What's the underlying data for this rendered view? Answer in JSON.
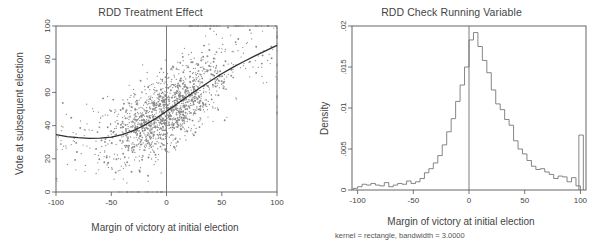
{
  "figure": {
    "width": 602,
    "height": 243,
    "background": "#ffffff",
    "panels": [
      "left",
      "right"
    ]
  },
  "chart_data": [
    {
      "type": "scatter",
      "panel": "left",
      "title": "RDD Treatment Effect",
      "xlabel": "Margin of victory at initial election",
      "ylabel": "Vote at subsequent election",
      "xlim": [
        -100,
        100
      ],
      "ylim": [
        0,
        100
      ],
      "xticks": [
        -100,
        -50,
        0,
        50,
        100
      ],
      "xtick_labels": [
        "-100",
        "-50",
        "0",
        "50",
        "100"
      ],
      "yticks": [
        0,
        20,
        40,
        60,
        80,
        100
      ],
      "ytick_labels": [
        "0",
        "20",
        "40",
        "60",
        "80",
        "100"
      ],
      "grid": false,
      "legend": "none",
      "marker_color": "#8a8a8a",
      "line_color": "#2f2f2f",
      "cutoff_line": {
        "x": 0,
        "color": "#6d6d6d",
        "label": "RDD cutoff at 0"
      },
      "fit_line": {
        "description": "quadratic-like fitted polynomial through scatter, continuous at cutoff",
        "points": [
          {
            "x": -100,
            "y": 34.5
          },
          {
            "x": -90,
            "y": 33.4
          },
          {
            "x": -80,
            "y": 32.7
          },
          {
            "x": -70,
            "y": 32.3
          },
          {
            "x": -60,
            "y": 32.4
          },
          {
            "x": -50,
            "y": 33.0
          },
          {
            "x": -40,
            "y": 34.6
          },
          {
            "x": -30,
            "y": 37.0
          },
          {
            "x": -20,
            "y": 40.2
          },
          {
            "x": -10,
            "y": 44.2
          },
          {
            "x": 0,
            "y": 48.6
          },
          {
            "x": 10,
            "y": 53.3
          },
          {
            "x": 20,
            "y": 58.0
          },
          {
            "x": 30,
            "y": 62.6
          },
          {
            "x": 40,
            "y": 67.0
          },
          {
            "x": 50,
            "y": 71.2
          },
          {
            "x": 60,
            "y": 75.1
          },
          {
            "x": 70,
            "y": 78.6
          },
          {
            "x": 80,
            "y": 82.0
          },
          {
            "x": 90,
            "y": 85.2
          },
          {
            "x": 100,
            "y": 88.3
          }
        ]
      },
      "n_points_approx": 1650,
      "notes": "dense cloud centred near (0,50); mass of points pinned at y=100 for x>20 and at y=0 for x between -50 and 0; vertical stripe of points at x=100"
    },
    {
      "type": "bar",
      "panel": "right",
      "title": "RDD Check Running Variable",
      "xlabel": "Margin of victory at initial election",
      "ylabel": "Density",
      "subtitle": "kernel = rectangle, bandwidth = 3.0000",
      "xlim": [
        -105,
        105
      ],
      "ylim": [
        0,
        0.02
      ],
      "xticks": [
        -100,
        -50,
        0,
        50,
        100
      ],
      "xtick_labels": [
        "-100",
        "-50",
        "0",
        "50",
        "100"
      ],
      "yticks": [
        0,
        0.005,
        0.01,
        0.015,
        0.02
      ],
      "ytick_labels": [
        "0",
        ".005",
        ".01",
        ".015",
        ".02"
      ],
      "grid": false,
      "legend": "none",
      "line_color": "#707070",
      "cutoff_line": {
        "x": 0,
        "color": "#6d6d6d",
        "label": "RDD cutoff at 0"
      },
      "bin_width": 4,
      "bin_left_edges": [
        -104,
        -100,
        -96,
        -92,
        -88,
        -84,
        -80,
        -76,
        -72,
        -68,
        -64,
        -60,
        -56,
        -52,
        -48,
        -44,
        -40,
        -36,
        -32,
        -28,
        -24,
        -20,
        -16,
        -12,
        -8,
        -4,
        0,
        4,
        8,
        12,
        16,
        20,
        24,
        28,
        32,
        36,
        40,
        44,
        48,
        52,
        56,
        60,
        64,
        68,
        72,
        76,
        80,
        84,
        88,
        92,
        96,
        100
      ],
      "values": [
        0.0002,
        0.0004,
        0.0007,
        0.0006,
        0.0008,
        0.0006,
        0.0005,
        0.0009,
        0.0004,
        0.0006,
        0.0008,
        0.0007,
        0.0011,
        0.0008,
        0.001,
        0.0014,
        0.0021,
        0.0026,
        0.0033,
        0.0042,
        0.0055,
        0.0071,
        0.0087,
        0.0108,
        0.0128,
        0.015,
        0.0183,
        0.0192,
        0.0175,
        0.0158,
        0.0143,
        0.0122,
        0.0105,
        0.0098,
        0.0086,
        0.0079,
        0.006,
        0.005,
        0.0044,
        0.0036,
        0.0029,
        0.0025,
        0.0026,
        0.0022,
        0.0019,
        0.0014,
        0.0017,
        0.0016,
        0.001,
        0.0015,
        0.0005,
        0.0067
      ],
      "spike": {
        "x": 100,
        "value": 0.0067,
        "note": "narrow spike at right boundary (margin = 100)"
      },
      "peak": {
        "x": 4,
        "value": 0.0192
      }
    }
  ]
}
